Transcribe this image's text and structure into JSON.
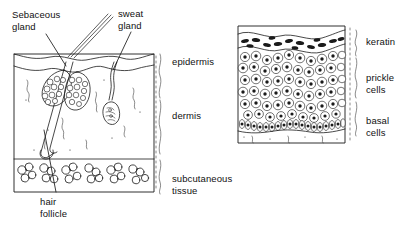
{
  "figure": {
    "ink_color": "#1a1a1a",
    "background_color": "#ffffff"
  },
  "left_panel": {
    "name": "skin-block-diagram",
    "callout_labels": [
      {
        "id": "sebaceous-gland",
        "text": "Sebaceous\ngland",
        "x": 12,
        "y": 9
      },
      {
        "id": "sweat-gland",
        "text": "sweat\ngland",
        "x": 118,
        "y": 8
      },
      {
        "id": "hair-follicle",
        "text": "hair\nfollicle",
        "x": 40,
        "y": 196
      }
    ],
    "layer_labels": [
      {
        "id": "epidermis",
        "text": "epidermis",
        "x": 172,
        "y": 56
      },
      {
        "id": "dermis",
        "text": "dermis",
        "x": 172,
        "y": 110
      },
      {
        "id": "subcutaneous-tissue",
        "text": "subcutaneous\ntissue",
        "x": 172,
        "y": 173
      }
    ]
  },
  "right_panel": {
    "name": "epidermis-histology-diagram",
    "layer_labels": [
      {
        "id": "keratin",
        "text": "keratin",
        "x": 366,
        "y": 36
      },
      {
        "id": "prickle-cells",
        "text": "prickle\ncells",
        "x": 366,
        "y": 72
      },
      {
        "id": "basal-cells",
        "text": "basal\ncells",
        "x": 366,
        "y": 115
      }
    ]
  }
}
